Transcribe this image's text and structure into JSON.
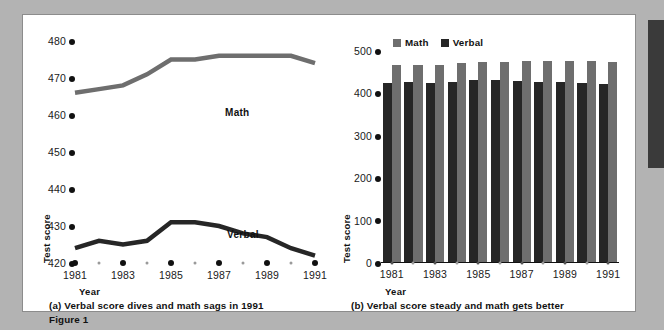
{
  "figure": {
    "label": "Figure 1",
    "background_color": "#b3b3b3",
    "panel_color": "#ffffff"
  },
  "colors": {
    "math": "#6e6e6e",
    "verbal": "#262626",
    "text": "#111111",
    "tick_dot": "#111111",
    "minor_dot": "#9a9a9a"
  },
  "panel_a": {
    "caption": "(a) Verbal score dives and math sags in 1991",
    "series_labels": {
      "math": "Math",
      "verbal": "Verbal"
    }
  },
  "panel_b": {
    "caption": "(b) Verbal score steady and math gets better",
    "legend": [
      {
        "label": "Math",
        "color": "#6e6e6e"
      },
      {
        "label": "Verbal",
        "color": "#262626"
      }
    ]
  },
  "chart_data": [
    {
      "type": "line",
      "title": "(a) Verbal score dives and math sags in 1991",
      "xlabel": "Year",
      "ylabel": "Test score",
      "ylim": [
        420,
        480
      ],
      "yticks": [
        420,
        430,
        440,
        450,
        460,
        470,
        480
      ],
      "xlim": [
        1981,
        1991
      ],
      "x": [
        1981,
        1982,
        1983,
        1984,
        1985,
        1986,
        1987,
        1988,
        1989,
        1990,
        1991
      ],
      "xticks": [
        1981,
        1983,
        1985,
        1987,
        1989,
        1991
      ],
      "xticklabels": [
        "1981",
        "1983",
        "1985",
        "1987",
        "1989",
        "1991"
      ],
      "grid": false,
      "legend": "inline-annotation",
      "series": [
        {
          "name": "Math",
          "color": "#6e6e6e",
          "values": [
            466,
            467,
            468,
            471,
            475,
            475,
            476,
            476,
            476,
            476,
            474
          ]
        },
        {
          "name": "Verbal",
          "color": "#262626",
          "values": [
            424,
            426,
            425,
            426,
            431,
            431,
            430,
            428,
            427,
            424,
            422
          ]
        }
      ]
    },
    {
      "type": "bar",
      "title": "(b) Verbal score steady and math gets better",
      "xlabel": "Year",
      "ylabel": "Test score",
      "ylim": [
        0,
        500
      ],
      "yticks": [
        0,
        100,
        200,
        300,
        400,
        500
      ],
      "categories": [
        "1981",
        "1982",
        "1983",
        "1984",
        "1985",
        "1986",
        "1987",
        "1988",
        "1989",
        "1990",
        "1991"
      ],
      "xticklabels": [
        "1981",
        "",
        "1983",
        "",
        "1985",
        "",
        "1987",
        "",
        "1989",
        "",
        "1991"
      ],
      "grid": false,
      "legend_position": "top-left",
      "series": [
        {
          "name": "Verbal",
          "color": "#262626",
          "values": [
            424,
            426,
            425,
            426,
            431,
            431,
            430,
            428,
            427,
            424,
            422
          ]
        },
        {
          "name": "Math",
          "color": "#6e6e6e",
          "values": [
            466,
            467,
            468,
            471,
            475,
            475,
            476,
            476,
            476,
            476,
            474
          ]
        }
      ]
    }
  ]
}
